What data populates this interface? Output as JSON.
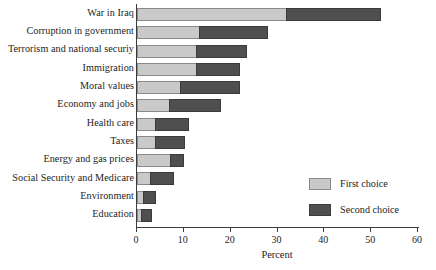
{
  "chart_data": {
    "type": "bar",
    "orientation": "horizontal",
    "stacked": true,
    "title": "",
    "xlabel": "Percent",
    "ylabel": "",
    "xlim": [
      0,
      60
    ],
    "xticks": [
      0,
      10,
      20,
      30,
      40,
      50,
      60
    ],
    "grid": false,
    "legend_position": "inner-right",
    "categories": [
      "War in Iraq",
      "Corruption in government",
      "Terrorism and national securiy",
      "Immigration",
      "Moral values",
      "Economy and jobs",
      "Health care",
      "Taxes",
      "Energy and gas prices",
      "Social Security and Medicare",
      "Environment",
      "Education"
    ],
    "series": [
      {
        "name": "First choice",
        "color": "#c9c9c9",
        "values": [
          32.0,
          13.5,
          12.8,
          12.8,
          9.4,
          7.0,
          4.0,
          4.0,
          7.3,
          3.0,
          1.5,
          1.0
        ]
      },
      {
        "name": "Second choice",
        "color": "#4f4f4f",
        "values": [
          20.0,
          14.5,
          10.7,
          9.2,
          12.6,
          11.0,
          7.0,
          6.3,
          2.7,
          5.0,
          2.5,
          2.2
        ]
      }
    ],
    "totals": [
      52.0,
      28.0,
      23.5,
      22.0,
      22.0,
      18.0,
      11.0,
      10.3,
      10.0,
      8.0,
      4.0,
      3.2
    ]
  },
  "axis": {
    "tick_labels": [
      "0",
      "10",
      "20",
      "30",
      "40",
      "50",
      "60"
    ],
    "x_title": "Percent"
  },
  "legend": {
    "items": [
      {
        "label": "First choice"
      },
      {
        "label": "Second choice"
      }
    ]
  }
}
